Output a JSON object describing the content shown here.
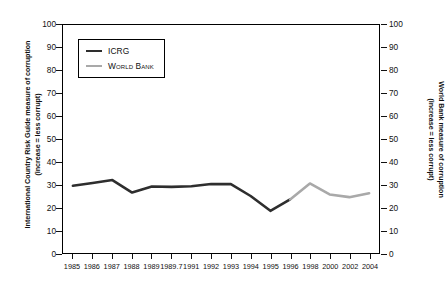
{
  "chart_data": {
    "type": "line",
    "title": "",
    "subtitle": "",
    "xlabel": "",
    "ylabel": "International Country Risk Guide measure of corruption (increase = less corrupt)",
    "ylabel_right": "World Bank measure of corruption (increase = less corrupt)",
    "ylim": [
      0,
      100
    ],
    "ylim_right": [
      0,
      100
    ],
    "yticks": [
      0,
      10,
      20,
      30,
      40,
      50,
      60,
      70,
      80,
      90,
      100
    ],
    "yticks_right": [
      0,
      10,
      20,
      30,
      40,
      50,
      60,
      70,
      80,
      90,
      100
    ],
    "categories": [
      "1985",
      "1986",
      "1987",
      "1988",
      "1989",
      "1989.7",
      "1991",
      "1992",
      "1993",
      "1994",
      "1995",
      "1996",
      "1998",
      "2000",
      "2002",
      "2004"
    ],
    "grid": false,
    "legend_position": "top-left",
    "series": [
      {
        "name": "ICRG",
        "color": "#2e2e2e",
        "axis": "left",
        "x": [
          "1985",
          "1986",
          "1987",
          "1988",
          "1989",
          "1989.7",
          "1991",
          "1992",
          "1993",
          "1994",
          "1995",
          "1996"
        ],
        "values": [
          29.5,
          30.7,
          32.0,
          26.5,
          29.2,
          29.0,
          29.3,
          30.3,
          30.2,
          25.0,
          18.5,
          23.5
        ]
      },
      {
        "name": "World Bank",
        "color": "#a9a9a9",
        "axis": "right",
        "x": [
          "1996",
          "1998",
          "2000",
          "2002",
          "2004"
        ],
        "values": [
          23.5,
          30.5,
          25.7,
          24.5,
          26.2
        ]
      }
    ]
  },
  "axes": {
    "left": {
      "title_line1": "International Country Risk Guide measure of corruption",
      "title_line2": "(increase = less corrupt)",
      "ticks": [
        "100",
        "90",
        "80",
        "70",
        "60",
        "50",
        "40",
        "30",
        "20",
        "10",
        "0"
      ]
    },
    "right": {
      "title_line1": "World Bank measure of corruption",
      "title_line2": "(increase = less corrupt)",
      "ticks": [
        "100",
        "90",
        "80",
        "70",
        "60",
        "50",
        "40",
        "30",
        "20",
        "10",
        "0"
      ]
    },
    "bottom": {
      "ticks": [
        "1985",
        "1986",
        "1987",
        "1988",
        "1989",
        "1989.7",
        "1991",
        "1992",
        "1993",
        "1994",
        "1995",
        "1996",
        "1998",
        "2000",
        "2002",
        "2004"
      ]
    }
  },
  "legend": {
    "items": [
      {
        "label": "ICRG",
        "color": "#2e2e2e"
      },
      {
        "label": "World Bank",
        "color": "#a9a9a9"
      }
    ]
  },
  "colors": {
    "icrg": "#2e2e2e",
    "world_bank": "#a9a9a9",
    "axis": "#000000",
    "background": "#ffffff"
  }
}
